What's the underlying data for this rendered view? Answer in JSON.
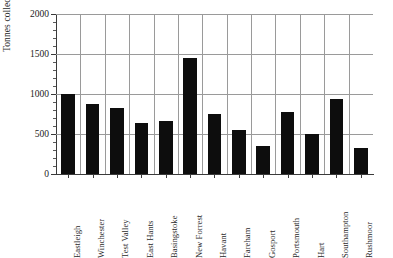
{
  "chart_data": {
    "type": "bar",
    "title": "",
    "xlabel": "",
    "ylabel": "Tonnes collected",
    "ylim": [
      0,
      2000
    ],
    "ytick_labels": [
      "0",
      "500",
      "1000",
      "1500",
      "2000"
    ],
    "ytick_values": [
      0,
      500,
      1000,
      1500,
      2000
    ],
    "ytick_minor_step": 100,
    "grid": "horizontal-and-vertical",
    "legend": "none",
    "bar_color": "#0d0d0d",
    "categories": [
      "Eastleigh",
      "Winchester",
      "Test Valley",
      "East Hants",
      "Basingstoke",
      "New Forrest",
      "Havant",
      "Fareham",
      "Gosport",
      "Portsmouth",
      "Hart",
      "Southampton",
      "Rushmoor"
    ],
    "values": [
      1000,
      870,
      820,
      640,
      660,
      1450,
      750,
      550,
      350,
      770,
      500,
      940,
      320
    ]
  }
}
